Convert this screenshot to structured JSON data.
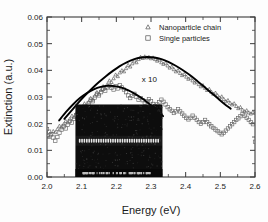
{
  "chart_data": {
    "type": "line",
    "title": "",
    "xlabel": "Energy (eV)",
    "ylabel": "Extinction (a.u.)",
    "xlim": [
      2.0,
      2.6
    ],
    "ylim": [
      0.0,
      0.06
    ],
    "xticks": [
      "2.0",
      "2.1",
      "2.2",
      "2.3",
      "2.4",
      "2.5",
      "2.6"
    ],
    "yticks": [
      "0.00",
      "0.01",
      "0.02",
      "0.03",
      "0.04",
      "0.05",
      "0.06"
    ],
    "xtick_values": [
      2.0,
      2.1,
      2.2,
      2.3,
      2.4,
      2.5,
      2.6
    ],
    "ytick_values": [
      0.0,
      0.01,
      0.02,
      0.03,
      0.04,
      0.05,
      0.06
    ],
    "grid": false,
    "legend_position": "top-right",
    "annotations": [
      {
        "text": "x 10",
        "x": 2.295,
        "y": 0.0355
      }
    ],
    "series": [
      {
        "name": "Nanoparticle chain",
        "marker": "triangle",
        "color": "#555555",
        "x": [
          2.0,
          2.006,
          2.012,
          2.018,
          2.024,
          2.03,
          2.036,
          2.042,
          2.048,
          2.054,
          2.06,
          2.066,
          2.072,
          2.078,
          2.084,
          2.09,
          2.096,
          2.102,
          2.108,
          2.114,
          2.12,
          2.126,
          2.132,
          2.138,
          2.144,
          2.15,
          2.156,
          2.162,
          2.168,
          2.174,
          2.18,
          2.186,
          2.192,
          2.198,
          2.204,
          2.21,
          2.216,
          2.222,
          2.228,
          2.234,
          2.24,
          2.246,
          2.252,
          2.258,
          2.264,
          2.27,
          2.276,
          2.282,
          2.288,
          2.294,
          2.3,
          2.306,
          2.312,
          2.318,
          2.324,
          2.33,
          2.336,
          2.342,
          2.348,
          2.354,
          2.36,
          2.366,
          2.372,
          2.378,
          2.384,
          2.39,
          2.396,
          2.402,
          2.408,
          2.414,
          2.42,
          2.426,
          2.432,
          2.438,
          2.444,
          2.45,
          2.456,
          2.462,
          2.468,
          2.474,
          2.48,
          2.486,
          2.492,
          2.498,
          2.504,
          2.51,
          2.516,
          2.522,
          2.528,
          2.534,
          2.54,
          2.546,
          2.552,
          2.558,
          2.564,
          2.57,
          2.576,
          2.582,
          2.588,
          2.594,
          2.6
        ],
        "y": [
          0.0165,
          0.015,
          0.016,
          0.0172,
          0.0168,
          0.018,
          0.0192,
          0.0186,
          0.0198,
          0.021,
          0.0205,
          0.0218,
          0.023,
          0.0225,
          0.0238,
          0.0252,
          0.0246,
          0.0262,
          0.0276,
          0.0268,
          0.0282,
          0.0296,
          0.029,
          0.0305,
          0.0318,
          0.0312,
          0.0326,
          0.034,
          0.0334,
          0.0348,
          0.0362,
          0.0356,
          0.037,
          0.0384,
          0.0378,
          0.0392,
          0.04,
          0.0396,
          0.0408,
          0.042,
          0.0414,
          0.0426,
          0.0436,
          0.043,
          0.0442,
          0.045,
          0.0446,
          0.0452,
          0.0448,
          0.045,
          0.0445,
          0.0448,
          0.0442,
          0.0436,
          0.044,
          0.043,
          0.0424,
          0.0428,
          0.0418,
          0.041,
          0.0414,
          0.0404,
          0.0396,
          0.04,
          0.039,
          0.0382,
          0.0386,
          0.0376,
          0.0368,
          0.0372,
          0.0362,
          0.0354,
          0.0358,
          0.0348,
          0.034,
          0.0344,
          0.0334,
          0.0326,
          0.033,
          0.032,
          0.0312,
          0.0316,
          0.0306,
          0.0298,
          0.0302,
          0.0292,
          0.0284,
          0.0288,
          0.0278,
          0.0272,
          0.0276,
          0.0266,
          0.0258,
          0.0262,
          0.0252,
          0.0246,
          0.025,
          0.0242,
          0.0238,
          0.0244,
          0.024
        ]
      },
      {
        "name": "Single particles",
        "marker": "square",
        "color": "#666666",
        "x": [
          2.0,
          2.006,
          2.012,
          2.018,
          2.024,
          2.03,
          2.036,
          2.042,
          2.048,
          2.054,
          2.06,
          2.066,
          2.072,
          2.078,
          2.084,
          2.09,
          2.096,
          2.102,
          2.108,
          2.114,
          2.12,
          2.126,
          2.132,
          2.138,
          2.144,
          2.15,
          2.156,
          2.162,
          2.168,
          2.174,
          2.18,
          2.186,
          2.192,
          2.198,
          2.204,
          2.21,
          2.216,
          2.222,
          2.228,
          2.234,
          2.24,
          2.246,
          2.252,
          2.258,
          2.264,
          2.27,
          2.276,
          2.282,
          2.288,
          2.294,
          2.3,
          2.306,
          2.312,
          2.318,
          2.324,
          2.33,
          2.336,
          2.342,
          2.348,
          2.354,
          2.36,
          2.366,
          2.372,
          2.378,
          2.384,
          2.39,
          2.396,
          2.402,
          2.408,
          2.414,
          2.42,
          2.426,
          2.432,
          2.438,
          2.444,
          2.45,
          2.456,
          2.462,
          2.468,
          2.474,
          2.48,
          2.486,
          2.492,
          2.498,
          2.504,
          2.51,
          2.516,
          2.522,
          2.528,
          2.534,
          2.54,
          2.546,
          2.552,
          2.558,
          2.564,
          2.57,
          2.576,
          2.582,
          2.588,
          2.594,
          2.6
        ],
        "y": [
          0.018,
          0.017,
          0.016,
          0.0148,
          0.0136,
          0.015,
          0.0166,
          0.0178,
          0.019,
          0.0182,
          0.0196,
          0.021,
          0.0204,
          0.0218,
          0.0232,
          0.0226,
          0.024,
          0.0254,
          0.0248,
          0.0262,
          0.0276,
          0.029,
          0.0284,
          0.0298,
          0.0312,
          0.0306,
          0.0318,
          0.033,
          0.0324,
          0.0336,
          0.0342,
          0.0334,
          0.0328,
          0.034,
          0.0332,
          0.0344,
          0.0336,
          0.0328,
          0.0318,
          0.0306,
          0.0296,
          0.0304,
          0.0312,
          0.03,
          0.029,
          0.0296,
          0.0288,
          0.0278,
          0.0284,
          0.0292,
          0.0284,
          0.0274,
          0.0266,
          0.0272,
          0.028,
          0.029,
          0.0282,
          0.0272,
          0.0262,
          0.0254,
          0.0248,
          0.024,
          0.0246,
          0.0254,
          0.0246,
          0.0238,
          0.023,
          0.0222,
          0.0216,
          0.0222,
          0.023,
          0.0222,
          0.0214,
          0.0206,
          0.02,
          0.0206,
          0.0214,
          0.0206,
          0.0198,
          0.019,
          0.0184,
          0.0178,
          0.0172,
          0.0166,
          0.016,
          0.0166,
          0.0174,
          0.0182,
          0.019,
          0.0198,
          0.0206,
          0.0214,
          0.022,
          0.0228,
          0.0236,
          0.023,
          0.0222,
          0.0214,
          0.0206,
          0.0198,
          0.0132
        ]
      }
    ],
    "fits": [
      {
        "name": "Nanoparticle chain fit",
        "color": "#000000",
        "x": [
          2.05,
          2.07,
          2.09,
          2.11,
          2.13,
          2.15,
          2.17,
          2.19,
          2.21,
          2.23,
          2.25,
          2.27,
          2.29,
          2.31,
          2.33,
          2.35,
          2.37,
          2.39,
          2.41,
          2.43,
          2.45,
          2.47,
          2.49,
          2.51,
          2.53
        ],
        "y": [
          0.0218,
          0.0248,
          0.0278,
          0.0306,
          0.0332,
          0.0356,
          0.0378,
          0.0398,
          0.0416,
          0.043,
          0.0441,
          0.0448,
          0.045,
          0.0448,
          0.0442,
          0.0432,
          0.0418,
          0.0402,
          0.0384,
          0.0364,
          0.0342,
          0.032,
          0.0298,
          0.0276,
          0.0256
        ]
      },
      {
        "name": "Single particles fit",
        "color": "#000000",
        "x": [
          2.035,
          2.055,
          2.075,
          2.095,
          2.115,
          2.135,
          2.155,
          2.175,
          2.195,
          2.215,
          2.235,
          2.255,
          2.275,
          2.295,
          2.315,
          2.335
        ],
        "y": [
          0.0212,
          0.0244,
          0.0272,
          0.0296,
          0.0315,
          0.0329,
          0.0338,
          0.0342,
          0.0341,
          0.0335,
          0.0325,
          0.0311,
          0.0294,
          0.0274,
          0.0252,
          0.0228
        ]
      }
    ],
    "inset": {
      "name": "sem-micrograph-inset",
      "description": "SEM micrograph of nanoparticle chain",
      "x_range": [
        2.082,
        2.333
      ],
      "y_range": [
        0.0,
        0.0272
      ],
      "background_color": "#0d0d0d",
      "particle_color": "#e8e8e8",
      "particle_count": 34,
      "scalebar_text": ""
    }
  },
  "legend": {
    "entries": [
      {
        "label": "Nanoparticle chain",
        "marker": "triangle"
      },
      {
        "label": "Single particles",
        "marker": "square"
      }
    ]
  }
}
